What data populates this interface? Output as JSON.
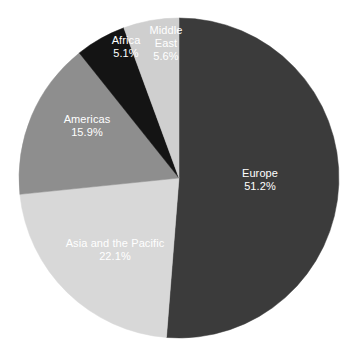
{
  "chart_data": {
    "type": "pie",
    "title": "",
    "subtitle": "",
    "xlabel": "",
    "ylabel": "",
    "legend": "none",
    "grid": false,
    "units": "percent",
    "start_angle_deg": 0,
    "direction": "clockwise",
    "background_color": "#ffffff",
    "label_color": "#ffffff",
    "categories": [
      "Europe",
      "Asia and the Pacific",
      "Americas",
      "Africa",
      "Middle East"
    ],
    "values": [
      51.2,
      22.1,
      15.9,
      5.1,
      5.6
    ],
    "slices": [
      {
        "label": "Europe",
        "value_text": "51.2%",
        "value": 51.2,
        "color": "#3b3b3b",
        "label_x": 260,
        "label_y": 180,
        "wrap": false
      },
      {
        "label": "Asia and the Pacific",
        "value_text": "22.1%",
        "value": 22.1,
        "color": "#d8d8d8",
        "label_x": 115,
        "label_y": 250,
        "wrap": false
      },
      {
        "label": "Americas",
        "value_text": "15.9%",
        "value": 15.9,
        "color": "#8e8e8e",
        "label_x": 87,
        "label_y": 126,
        "wrap": false
      },
      {
        "label": "Africa",
        "value_text": "5.1%",
        "value": 5.1,
        "color": "#141414",
        "label_x": 126,
        "label_y": 47,
        "wrap": false
      },
      {
        "label": "Middle East",
        "value_text": "5.6%",
        "value": 5.6,
        "color": "#cfcfcf",
        "label_x": 166,
        "label_y": 43,
        "wrap": true
      }
    ],
    "geometry": {
      "center_x": 179,
      "center_y": 178,
      "radius": 160
    }
  }
}
